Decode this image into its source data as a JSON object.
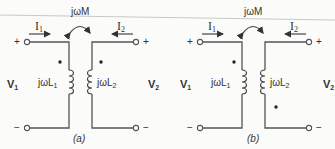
{
  "diagrams": [
    {
      "caption": "(a)",
      "mutual": "jωM",
      "current1": "I",
      "current1_sub": "1",
      "current2": "I",
      "current2_sub": "2",
      "voltage1": "V",
      "voltage1_sub": "1",
      "voltage2": "V",
      "voltage2_sub": "2",
      "inductor1": "jωL",
      "inductor1_sub": "1",
      "inductor2": "jωL",
      "inductor2_sub": "2",
      "plus": "+",
      "minus": "−",
      "dot_convention": "both dots at top"
    },
    {
      "caption": "(b)",
      "mutual": "jωM",
      "current1": "I",
      "current1_sub": "1",
      "current2": "I",
      "current2_sub": "2",
      "voltage1": "V",
      "voltage1_sub": "1",
      "voltage2": "V",
      "voltage2_sub": "2",
      "inductor1": "jωL",
      "inductor1_sub": "1",
      "inductor2": "jωL",
      "inductor2_sub": "2",
      "plus": "+",
      "minus": "−",
      "dot_convention": "primary dot top, secondary dot bottom"
    }
  ]
}
